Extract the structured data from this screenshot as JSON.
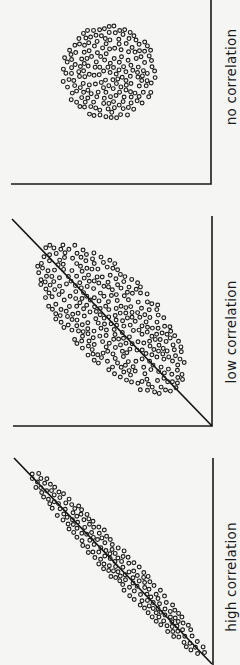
{
  "figure": {
    "background": "#f5f5f3",
    "ink": "#1a1a1a",
    "orientation": "rotated 90 degrees clockwise (labels read bottom-to-top)"
  },
  "chart_data": [
    {
      "type": "scatter",
      "title": "no correlation",
      "xlabel": "",
      "ylabel": "",
      "grid": false,
      "trend_line": false,
      "correlation": "none",
      "cloud_shape": "circle",
      "approx_points": 190
    },
    {
      "type": "scatter",
      "title": "low correlation",
      "xlabel": "",
      "ylabel": "",
      "grid": false,
      "trend_line": true,
      "correlation": "low",
      "cloud_shape": "wide ellipse along diagonal",
      "approx_points": 330
    },
    {
      "type": "scatter",
      "title": "high correlation",
      "xlabel": "",
      "ylabel": "",
      "grid": false,
      "trend_line": true,
      "correlation": "high",
      "cloud_shape": "narrow band along diagonal",
      "approx_points": 230
    }
  ],
  "panels": [
    {
      "label": "no correlation",
      "label_pos": {
        "x": 232,
        "y": 77
      },
      "axes": {
        "corner": [
          211,
          184
        ],
        "vtop": 0,
        "hleft": 11
      },
      "trend": null,
      "cloud": {
        "cx": 109,
        "cy": 72,
        "rx": 47,
        "ry": 47,
        "angle": 0,
        "count": 190,
        "seed": 11
      }
    },
    {
      "label": "low correlation",
      "label_pos": {
        "x": 232,
        "y": 332
      },
      "axes": {
        "corner": [
          212,
          426
        ],
        "vtop": 216,
        "hleft": 13
      },
      "trend": {
        "x1": 12,
        "y1": 219,
        "x2": 212,
        "y2": 426
      },
      "cloud": {
        "cx": 111,
        "cy": 318,
        "rx": 96,
        "ry": 44,
        "angle": 46,
        "count": 330,
        "seed": 23
      }
    },
    {
      "label": "high correlation",
      "label_pos": {
        "x": 232,
        "y": 577
      },
      "axes": {
        "corner": [
          213,
          665
        ],
        "vtop": 458,
        "hleft": null
      },
      "trend": {
        "x1": 14,
        "y1": 458,
        "x2": 212,
        "y2": 664
      },
      "cloud": {
        "cx": 117,
        "cy": 563,
        "rx": 128,
        "ry": 14,
        "angle": 46.5,
        "count": 230,
        "seed": 37
      }
    }
  ]
}
